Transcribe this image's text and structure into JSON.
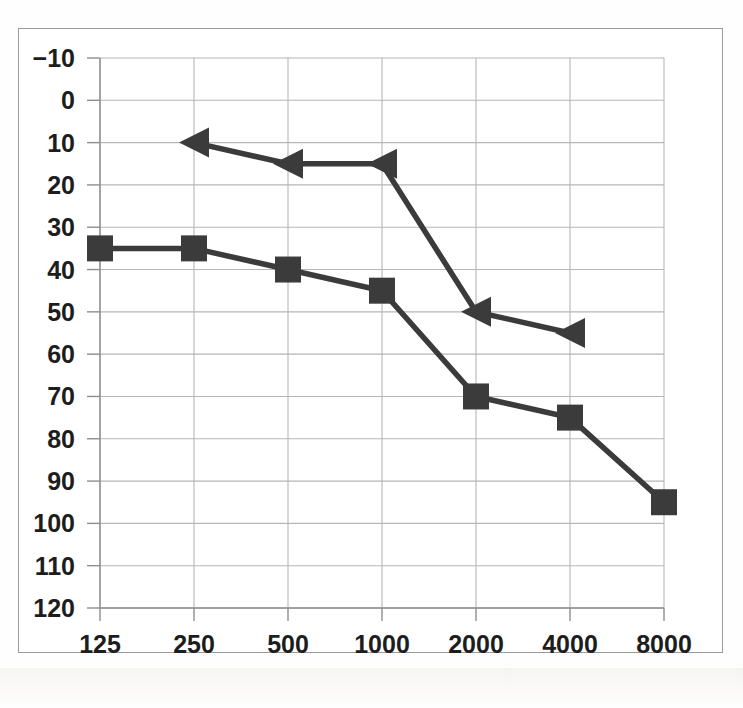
{
  "chart_data": {
    "type": "line",
    "title": "",
    "subtitle": "",
    "xlabel": "",
    "ylabel": "",
    "x": [
      125,
      250,
      500,
      1000,
      2000,
      4000,
      8000
    ],
    "categories": [
      "125",
      "250",
      "500",
      "1000",
      "2000",
      "4000",
      "8000"
    ],
    "x_tick_labels": [
      "125",
      "250",
      "500",
      "1000",
      "2000",
      "4000",
      "8000"
    ],
    "y_tick_labels": [
      "-10",
      "0",
      "10",
      "20",
      "30",
      "40",
      "50",
      "60",
      "70",
      "80",
      "90",
      "100",
      "110",
      "120"
    ],
    "y_ticks": [
      -10,
      0,
      10,
      20,
      30,
      40,
      50,
      60,
      70,
      80,
      90,
      100,
      110,
      120
    ],
    "ylim": [
      -10,
      120
    ],
    "y_inverted": true,
    "grid": true,
    "legend": "none",
    "series": [
      {
        "name": "air-conduction-square",
        "marker": "square",
        "color": "#3b3b3b",
        "x": [
          125,
          250,
          500,
          1000,
          2000,
          4000,
          8000
        ],
        "values": [
          35,
          35,
          40,
          45,
          70,
          75,
          95
        ]
      },
      {
        "name": "bone-conduction-triangle-left",
        "marker": "triangle-left",
        "color": "#3b3b3b",
        "x": [
          250,
          500,
          1000,
          2000,
          4000
        ],
        "values": [
          10,
          15,
          15,
          50,
          55
        ]
      }
    ],
    "annotations": []
  },
  "colors": {
    "series": "#3b3b3b",
    "gridline": "#b6b6b6",
    "axis": "#8e8e8e",
    "frame": "#9a9a9a",
    "background": "#ffffff",
    "text": "#1d1d1d"
  }
}
